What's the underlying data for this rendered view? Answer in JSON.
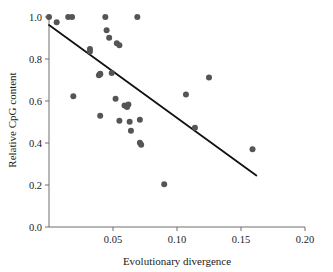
{
  "chart_data": {
    "type": "scatter",
    "title": "",
    "xlabel": "Evolutionary divergence",
    "ylabel": "Relative CpG content",
    "xlim": [
      0.0,
      0.2
    ],
    "ylim": [
      0.0,
      1.0
    ],
    "xticks": [
      0.0,
      0.05,
      0.1,
      0.15,
      0.2
    ],
    "xtick_labels": [
      "",
      "0.05",
      "0.10",
      "0.15",
      "0.20"
    ],
    "yticks": [
      0.0,
      0.2,
      0.4,
      0.6,
      0.8,
      1.0
    ],
    "ytick_labels": [
      "0.0",
      "0.2",
      "0.4",
      "0.6",
      "0.8",
      "1.0"
    ],
    "grid": false,
    "legend": false,
    "marker_color": "#555555",
    "marker_size": 3.0,
    "series": [
      {
        "name": "genes",
        "points": [
          [
            0.0,
            1.0
          ],
          [
            0.006,
            0.975
          ],
          [
            0.015,
            1.0
          ],
          [
            0.018,
            1.0
          ],
          [
            0.019,
            0.623
          ],
          [
            0.032,
            0.848
          ],
          [
            0.032,
            0.836
          ],
          [
            0.039,
            0.723
          ],
          [
            0.04,
            0.73
          ],
          [
            0.04,
            0.727
          ],
          [
            0.04,
            0.53
          ],
          [
            0.044,
            1.0
          ],
          [
            0.045,
            0.937
          ],
          [
            0.047,
            0.901
          ],
          [
            0.049,
            0.733
          ],
          [
            0.053,
            0.875
          ],
          [
            0.055,
            0.866
          ],
          [
            0.052,
            0.611
          ],
          [
            0.055,
            0.506
          ],
          [
            0.059,
            0.578
          ],
          [
            0.061,
            0.571
          ],
          [
            0.062,
            0.583
          ],
          [
            0.063,
            0.501
          ],
          [
            0.064,
            0.458
          ],
          [
            0.069,
            1.0
          ],
          [
            0.071,
            0.511
          ],
          [
            0.071,
            0.401
          ],
          [
            0.072,
            0.392
          ],
          [
            0.09,
            0.204
          ],
          [
            0.107,
            0.631
          ],
          [
            0.114,
            0.473
          ],
          [
            0.125,
            0.712
          ],
          [
            0.159,
            0.37
          ]
        ]
      }
    ],
    "fit_line": {
      "name": "regression-line",
      "color": "#111111",
      "x_start": 0.0,
      "y_start": 0.962,
      "x_end": 0.162,
      "y_end": 0.245
    }
  }
}
